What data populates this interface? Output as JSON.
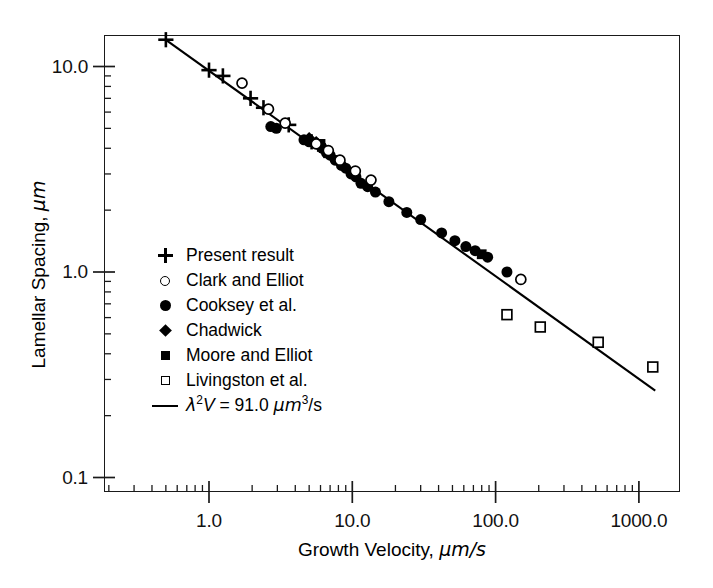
{
  "chart_data": {
    "type": "scatter",
    "title": "",
    "xlabel": "Growth Velocity, µm/s",
    "ylabel": "Lamellar Spacing, µm",
    "xscale": "log",
    "yscale": "log",
    "xlim": [
      0.4,
      2000.0
    ],
    "ylim": [
      0.1,
      17.0
    ],
    "grid": false,
    "legend_position": "lower-left-inside",
    "xticks": [
      "1.0",
      "10.0",
      "100.0",
      "1000.0"
    ],
    "xtick_values": [
      1.0,
      10.0,
      100.0,
      1000.0
    ],
    "yticks": [
      "10.0",
      "1.0",
      "0.1"
    ],
    "ytick_values": [
      10.0,
      1.0,
      0.1
    ],
    "annotation": "λ²V = 91.0 µm³/s",
    "fit": {
      "label": "λ²V = 91.0 µm³/s",
      "constant": 91.0,
      "units": "µm³/s",
      "exponent": -0.5,
      "x_start": 0.5,
      "x_end": 1300.0
    },
    "series": [
      {
        "name": "Present result",
        "marker": "plus",
        "filled": true,
        "points": [
          [
            0.5,
            13.5
          ],
          [
            1.0,
            9.6
          ],
          [
            1.25,
            9.0
          ],
          [
            1.95,
            7.0
          ],
          [
            2.4,
            6.3
          ],
          [
            3.6,
            5.2
          ],
          [
            5.2,
            4.3
          ],
          [
            6.4,
            3.9
          ]
        ]
      },
      {
        "name": "Clark and Elliot",
        "marker": "open-circle",
        "filled": false,
        "points": [
          [
            1.7,
            8.3
          ],
          [
            2.6,
            6.2
          ],
          [
            3.4,
            5.3
          ],
          [
            5.6,
            4.2
          ],
          [
            6.8,
            3.9
          ],
          [
            8.2,
            3.5
          ],
          [
            10.5,
            3.1
          ],
          [
            13.5,
            2.8
          ],
          [
            150.0,
            0.92
          ]
        ]
      },
      {
        "name": "Cooksey et al.",
        "marker": "filled-circle",
        "filled": true,
        "points": [
          [
            2.7,
            5.1
          ],
          [
            2.95,
            5.0
          ],
          [
            4.6,
            4.4
          ],
          [
            5.0,
            4.3
          ],
          [
            5.7,
            4.2
          ],
          [
            6.2,
            4.0
          ],
          [
            6.6,
            3.8
          ],
          [
            7.0,
            3.7
          ],
          [
            7.6,
            3.5
          ],
          [
            8.4,
            3.3
          ],
          [
            9.0,
            3.2
          ],
          [
            9.8,
            3.0
          ],
          [
            10.6,
            2.9
          ],
          [
            11.5,
            2.7
          ],
          [
            12.8,
            2.6
          ],
          [
            14.5,
            2.45
          ],
          [
            18.0,
            2.2
          ],
          [
            24.0,
            1.95
          ],
          [
            30.0,
            1.8
          ],
          [
            42.0,
            1.55
          ],
          [
            52.0,
            1.42
          ],
          [
            62.0,
            1.33
          ],
          [
            72.0,
            1.27
          ],
          [
            88.0,
            1.18
          ],
          [
            120.0,
            1.0
          ]
        ]
      },
      {
        "name": "Chadwick",
        "marker": "filled-diamond",
        "filled": true,
        "points": [
          [
            5.0,
            4.5
          ],
          [
            5.6,
            4.3
          ],
          [
            6.1,
            4.1
          ]
        ]
      },
      {
        "name": "Moore and Elliot",
        "marker": "filled-square",
        "filled": true,
        "points": [
          [
            6.0,
            4.2
          ],
          [
            10.5,
            3.0
          ],
          [
            80.0,
            1.22
          ]
        ]
      },
      {
        "name": "Livingston et al.",
        "marker": "open-square",
        "filled": false,
        "points": [
          [
            120.0,
            0.62
          ],
          [
            205.0,
            0.54
          ],
          [
            520.0,
            0.455
          ],
          [
            1250.0,
            0.345
          ]
        ]
      }
    ]
  },
  "axis": {
    "x_title": "Growth Velocity, ",
    "x_title_unit": "µm/s",
    "y_title": "Lamellar Spacing, ",
    "y_title_unit": "µm"
  },
  "legend": {
    "items": [
      {
        "label": "Present result",
        "marker": "plus-icon"
      },
      {
        "label": "Clark and Elliot",
        "marker": "open-circle-icon"
      },
      {
        "label": "Cooksey et al.",
        "marker": "filled-circle-icon"
      },
      {
        "label": "Chadwick",
        "marker": "filled-diamond-icon"
      },
      {
        "label": "Moore and Elliot",
        "marker": "filled-square-icon"
      },
      {
        "label": "Livingston et al.",
        "marker": "open-square-icon"
      }
    ],
    "fit_label_prefix": "λ",
    "fit_label_sup": "2",
    "fit_label_v": "V",
    "fit_label_eq": " = 91.0 ",
    "fit_label_mu": "µm",
    "fit_label_mu_sup": "3",
    "fit_label_tail": "/s"
  },
  "colors": {
    "axis": "#1a1a1a",
    "marker": "#000000",
    "line": "#000000",
    "background": "#ffffff"
  }
}
